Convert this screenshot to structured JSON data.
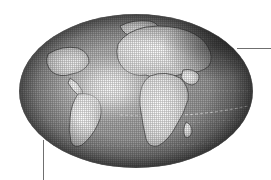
{
  "figure": {
    "background_color": "#ffffff",
    "width": 271,
    "height": 180
  },
  "globe": {
    "label": "Earth globe centered on the Atlantic Ocean",
    "projection": "orthographic-ellipse",
    "center_x": 136,
    "center_y": 91,
    "radius_x": 117,
    "radius_y": 77,
    "style": "grayscale halftone raster",
    "ocean_color": "#8d8d8d",
    "land_color": "#e2e2e2",
    "rim_shadow_color": "#4a4a4a",
    "highlight_color": "#fdfdfd",
    "highlight_center_x": 110,
    "highlight_center_y": 88,
    "graticule_color": "#bdbdbd",
    "landmasses": [
      {
        "name": "Europe",
        "label": "Europe"
      },
      {
        "name": "Asia",
        "label": "Asia"
      },
      {
        "name": "Africa",
        "label": "Africa"
      },
      {
        "name": "South America",
        "label": "South America"
      },
      {
        "name": "North America",
        "label": "North America"
      },
      {
        "name": "Greenland",
        "label": "Greenland"
      }
    ],
    "graticules": [
      {
        "name": "equator",
        "label": "Equator",
        "y": 116
      },
      {
        "name": "tropic-line",
        "label": "Tropic line",
        "y": 92
      }
    ]
  },
  "annotations": {
    "leader_lines": [
      {
        "name": "leader-line-right",
        "orientation": "horizontal",
        "color": "#6f6f6f",
        "start_x": 237,
        "start_y": 48,
        "end_x": 271,
        "end_y": 48
      },
      {
        "name": "leader-line-bottom",
        "orientation": "vertical",
        "color": "#6f6f6f",
        "start_x": 43,
        "start_y": 140,
        "end_x": 43,
        "end_y": 180
      }
    ]
  }
}
